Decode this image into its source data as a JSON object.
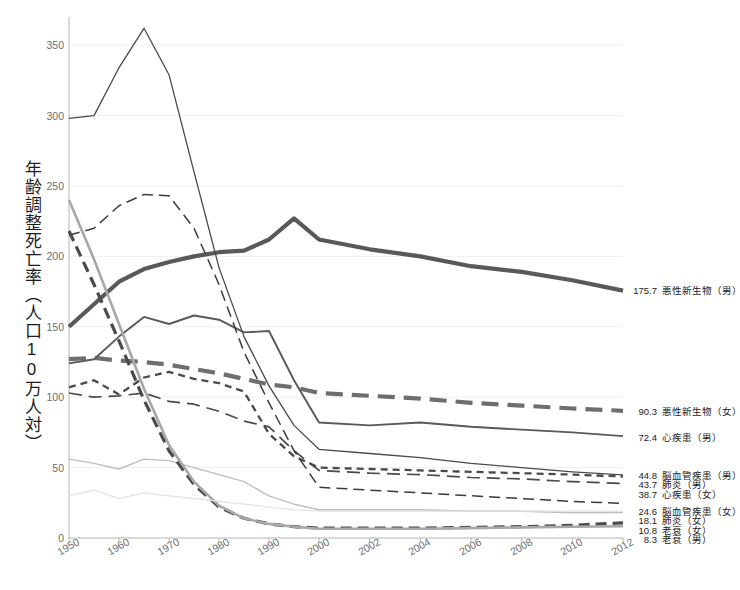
{
  "chart_data": {
    "type": "line",
    "title": "",
    "xlabel": "",
    "ylabel": "年齢調整死亡率（人口10万人対）",
    "xlim": [
      1950,
      2012
    ],
    "ylim": [
      0,
      370
    ],
    "yticks": [
      0,
      50,
      100,
      150,
      200,
      250,
      300,
      350
    ],
    "ytick_labels": [
      "0",
      "50",
      "100",
      "150",
      "200",
      "250",
      "300",
      "350"
    ],
    "xticks": [
      1950,
      1960,
      1970,
      1980,
      1990,
      2000,
      2002,
      2004,
      2006,
      2008,
      2010,
      2012
    ],
    "xtick_labels": [
      "1950",
      "1960",
      "1970",
      "1980",
      "1990",
      "2000",
      "2002",
      "2004",
      "2006",
      "2008",
      "2010",
      "2012"
    ],
    "grid": true,
    "legend_position": "right-inline",
    "x": [
      1950,
      1955,
      1960,
      1965,
      1970,
      1975,
      1980,
      1985,
      1990,
      1995,
      2000,
      2002,
      2004,
      2006,
      2008,
      2010,
      2012
    ],
    "series": [
      {
        "name": "悪性新生物（男）",
        "end_value": "175.7",
        "color": "#595959",
        "width": 4.2,
        "dash": "none",
        "values": [
          150,
          166,
          182,
          191,
          196,
          200,
          203,
          204,
          212,
          227,
          212,
          205,
          200,
          193,
          189,
          183,
          175.7
        ]
      },
      {
        "name": "悪性新生物（女）",
        "end_value": "90.3",
        "color": "#6e6e6e",
        "width": 4.2,
        "dash": "17,9",
        "values": [
          127,
          128,
          126,
          125,
          123,
          120,
          117,
          113,
          109,
          107,
          103,
          101,
          99,
          96,
          94,
          92,
          90.3
        ]
      },
      {
        "name": "心疾患（男）",
        "end_value": "72.4",
        "color": "#595959",
        "width": 1.9,
        "dash": "none",
        "values": [
          124,
          127,
          143,
          157,
          152,
          158,
          155,
          146,
          147,
          112,
          82,
          80,
          82,
          79,
          77,
          75,
          72.4
        ]
      },
      {
        "name": "脳血管疾患（男）",
        "end_value": "44.8",
        "color": "#4a4a4a",
        "width": 1.3,
        "dash": "none",
        "values": [
          298,
          300,
          334,
          362,
          329,
          260,
          192,
          143,
          108,
          80,
          63,
          60,
          57,
          53,
          50,
          47,
          44.8
        ]
      },
      {
        "name": "肺炎（男）",
        "end_value": "43.7",
        "color": "#4a4a4a",
        "width": 2.3,
        "dash": "7,5",
        "values": [
          107,
          112,
          102,
          114,
          118,
          113,
          110,
          104,
          74,
          58,
          50,
          49,
          48,
          47,
          46,
          45,
          43.7
        ]
      },
      {
        "name": "心疾患（女）",
        "end_value": "38.7",
        "color": "#4a4a4a",
        "width": 1.7,
        "dash": "13,7",
        "values": [
          103,
          100,
          101,
          103,
          97,
          95,
          90,
          83,
          79,
          62,
          48,
          46,
          45,
          43,
          42,
          40,
          38.7
        ]
      },
      {
        "name": "脳血管疾患（女）",
        "end_value": "24.6",
        "color": "#3b3b3b",
        "width": 1.5,
        "dash": "11,6",
        "values": [
          215,
          220,
          236,
          244,
          243,
          220,
          180,
          132,
          96,
          62,
          36,
          34,
          32,
          30,
          28,
          26,
          24.6
        ]
      },
      {
        "name": "肺炎（女）",
        "end_value": "18.1",
        "color": "#bfbfbf",
        "width": 1.4,
        "dash": "none",
        "values": [
          56,
          53,
          49,
          56,
          55,
          50,
          45,
          40,
          30,
          24,
          20,
          20,
          20,
          19,
          19,
          18,
          18.1
        ]
      },
      {
        "name": "老衰（女）",
        "end_value": "10.8",
        "color": "#4a4a4a",
        "width": 3.2,
        "dash": "11,6",
        "values": [
          218,
          180,
          140,
          98,
          62,
          38,
          22,
          14,
          10,
          8,
          7,
          7,
          7,
          7.5,
          8,
          9,
          10.8
        ]
      },
      {
        "name": "老衰（男）",
        "end_value": "8.3",
        "color": "#a8a8a8",
        "width": 2.6,
        "dash": "none",
        "values": [
          240,
          198,
          152,
          106,
          66,
          40,
          23,
          14,
          10,
          8,
          6.5,
          6.5,
          6.5,
          7,
          7.5,
          8,
          8.3
        ]
      },
      {
        "name": "faint-low-female",
        "end_value": "",
        "color": "#e2e2e2",
        "width": 1.2,
        "dash": "none",
        "values": [
          30,
          34,
          28,
          32,
          30,
          28,
          26,
          24,
          22,
          20,
          19,
          19,
          19,
          19,
          19,
          19,
          19
        ]
      }
    ],
    "right_labels": [
      {
        "value": "175.7",
        "name": "悪性新生物（男）",
        "y": 176
      },
      {
        "value": "90.3",
        "name": "悪性新生物（女）",
        "y": 90
      },
      {
        "value": "72.4",
        "name": "心疾患（男）",
        "y": 72
      },
      {
        "value": "44.8",
        "name": "脳血管疾患（男）",
        "y": 45
      },
      {
        "value": "43.7",
        "name": "肺炎（男）",
        "y": 38
      },
      {
        "value": "38.7",
        "name": "心疾患（女）",
        "y": 31
      },
      {
        "value": "24.6",
        "name": "脳血管疾患（女）",
        "y": 19
      },
      {
        "value": "18.1",
        "name": "肺炎（女）",
        "y": 12.5
      },
      {
        "value": "10.8",
        "name": "老衰（女）",
        "y": 6
      },
      {
        "value": "8.3",
        "name": "老衰（男）",
        "y": -0.5
      }
    ]
  }
}
